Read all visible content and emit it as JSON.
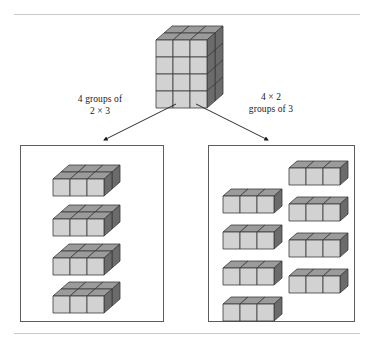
{
  "figure": {
    "background": "#ffffff",
    "rules": {
      "color": "#c9c9c9",
      "top_y": 14,
      "bottom_y": 333
    }
  },
  "colors": {
    "face_front": "#d2d2d2",
    "face_top": "#9b9b9b",
    "face_side": "#6b6b6b",
    "edge": "#3a3a3a",
    "panel_border": "#5c5c5c",
    "rule": "#c9c9c9",
    "text": "#1a1a1a"
  },
  "source_block": {
    "name": "main-cube",
    "width_cubes": 3,
    "height_cubes": 4,
    "depth_cubes": 2,
    "total_cubes": 24,
    "position": {
      "x": 155,
      "y": 25
    }
  },
  "labels": {
    "left": "4 groups of\n2 × 3",
    "right": "4 × 2\ngroups of 3"
  },
  "arrows": [
    {
      "name": "arrow-left",
      "x1": 176,
      "y1": 104,
      "x2": 104,
      "y2": 140,
      "direction": "down-left"
    },
    {
      "name": "arrow-right",
      "x1": 196,
      "y1": 104,
      "x2": 268,
      "y2": 140,
      "direction": "down-right"
    }
  ],
  "panels": [
    {
      "name": "panel-left",
      "grouping": "4 groups of 2 × 3",
      "group_count": 4,
      "group_shape": {
        "width_cubes": 3,
        "height_cubes": 1,
        "depth_cubes": 2,
        "cubes_per_group": 6
      },
      "total_cubes": 24,
      "layout": "single column of 4 slabs",
      "slabs": [
        {
          "x": 52,
          "y": 164
        },
        {
          "x": 52,
          "y": 204
        },
        {
          "x": 52,
          "y": 243
        },
        {
          "x": 52,
          "y": 281
        }
      ]
    },
    {
      "name": "panel-right",
      "grouping": "4 × 2 groups of 3",
      "group_count": 8,
      "group_shape": {
        "width_cubes": 3,
        "height_cubes": 1,
        "depth_cubes": 1,
        "cubes_per_group": 3
      },
      "total_cubes": 24,
      "layout": "two columns of 4 rows",
      "rows": [
        {
          "x": 288,
          "y": 160
        },
        {
          "x": 288,
          "y": 196
        },
        {
          "x": 288,
          "y": 232
        },
        {
          "x": 288,
          "y": 268
        },
        {
          "x": 222,
          "y": 188
        },
        {
          "x": 222,
          "y": 224
        },
        {
          "x": 222,
          "y": 260
        },
        {
          "x": 222,
          "y": 296
        }
      ]
    }
  ],
  "chart_data": {
    "type": "diagram",
    "total_cubes": 24,
    "source": {
      "dimensions": "3 × 4 × 2",
      "cubes": 24
    },
    "decompositions": [
      {
        "label": "4 groups of 2 × 3",
        "groups": 4,
        "cubes_per_group": 6,
        "product": 24
      },
      {
        "label": "4 × 2 groups of 3",
        "groups": 8,
        "cubes_per_group": 3,
        "product": 24
      }
    ]
  }
}
